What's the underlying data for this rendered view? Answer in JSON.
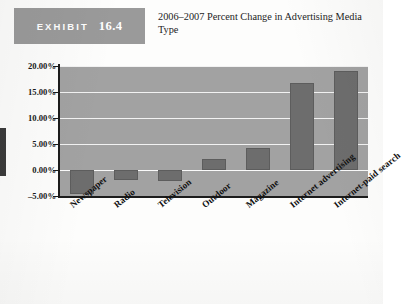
{
  "exhibit": {
    "word": "EXHIBIT",
    "number": "16.4",
    "title": "2006–2007 Percent Change in Advertising Media Type"
  },
  "chart_data": {
    "type": "bar",
    "title": "2006–2007 Percent Change in Advertising Media Type",
    "xlabel": "",
    "ylabel": "",
    "categories": [
      "Newspaper",
      "Radio",
      "Television",
      "Outdoor",
      "Magazine",
      "Internet advertising",
      "Internet-paid search"
    ],
    "values": [
      -4.6,
      -1.9,
      -2.2,
      2.2,
      4.2,
      16.8,
      19.1
    ],
    "ylim": [
      -5,
      20
    ],
    "yticks": [
      20,
      15,
      10,
      5,
      0,
      -5
    ],
    "ytick_labels": [
      "20.00%",
      "15.00%",
      "10.00%",
      "5.00%",
      "0.00%",
      "–5.00%"
    ],
    "grid": true,
    "legend": false,
    "colors": {
      "bar": "#6d6d6d",
      "plot_background": "#a2a2a2",
      "gridline": "#f2f2f2",
      "axis": "#1c1c1c",
      "exhibit_tag": "#9a9a9a"
    }
  }
}
